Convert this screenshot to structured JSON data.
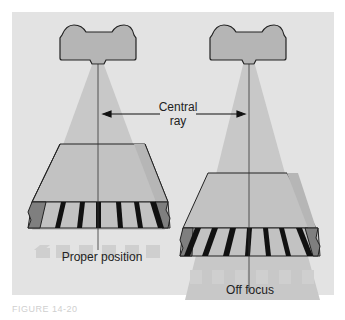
{
  "figure": {
    "labels": {
      "central_ray_line1": "Central",
      "central_ray_line2": "ray",
      "left_caption": "Proper position",
      "right_caption": "Off focus"
    },
    "caption": "FIGURE 14-20",
    "colors": {
      "panel_bg": "#e3e3e3",
      "tube_fill": "#b5b5b5",
      "beam": "#c8c8c8",
      "grid_body": "#c2c2c2",
      "grid_end": "#7f7f7f",
      "lead_strip": "#111111",
      "outline": "#222222"
    }
  }
}
